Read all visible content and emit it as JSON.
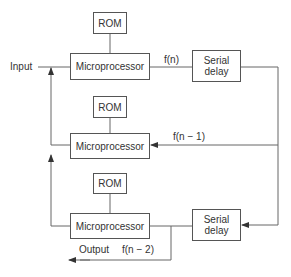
{
  "diagram": {
    "input_label": "Input",
    "output_label": "Output",
    "stages": [
      {
        "rom": "ROM",
        "processor": "Microprocessor",
        "signal": "f(n)"
      },
      {
        "rom": "ROM",
        "processor": "Microprocessor",
        "signal": "f(n − 1)"
      },
      {
        "rom": "ROM",
        "processor": "Microprocessor",
        "signal": "f(n − 2)"
      }
    ],
    "delays": [
      {
        "label_line1": "Serial",
        "label_line2": "delay"
      },
      {
        "label_line1": "Serial",
        "label_line2": "delay"
      }
    ],
    "colors": {
      "line": "#555555",
      "text": "#333333",
      "background": "#ffffff"
    }
  }
}
